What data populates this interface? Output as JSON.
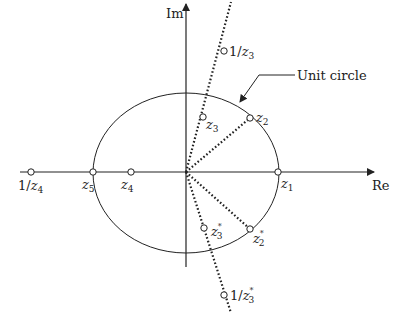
{
  "diagram": {
    "axes": {
      "real_label": "Re",
      "imag_label": "Im"
    },
    "unit_circle_label": "Unit circle",
    "points": [
      {
        "id": "z1",
        "label": "z",
        "sub": "1",
        "sup": "",
        "prefix": ""
      },
      {
        "id": "z2",
        "label": "z",
        "sub": "2",
        "sup": "",
        "prefix": ""
      },
      {
        "id": "z3",
        "label": "z",
        "sub": "3",
        "sup": "",
        "prefix": ""
      },
      {
        "id": "z4",
        "label": "z",
        "sub": "4",
        "sup": "",
        "prefix": ""
      },
      {
        "id": "z5",
        "label": "z",
        "sub": "5",
        "sup": "",
        "prefix": ""
      },
      {
        "id": "inv_z3",
        "label": "z",
        "sub": "3",
        "sup": "",
        "prefix": "1/"
      },
      {
        "id": "inv_z4",
        "label": "z",
        "sub": "4",
        "sup": "",
        "prefix": "1/"
      },
      {
        "id": "z2_conj",
        "label": "z",
        "sub": "2",
        "sup": "*",
        "prefix": ""
      },
      {
        "id": "z3_conj",
        "label": "z",
        "sub": "3",
        "sup": "*",
        "prefix": ""
      },
      {
        "id": "inv_z3_conj",
        "label": "z",
        "sub": "3",
        "sup": "*",
        "prefix": "1/"
      }
    ],
    "colors": {
      "stroke": "#222222",
      "point_fill": "#ffffff",
      "background": "#ffffff"
    }
  }
}
